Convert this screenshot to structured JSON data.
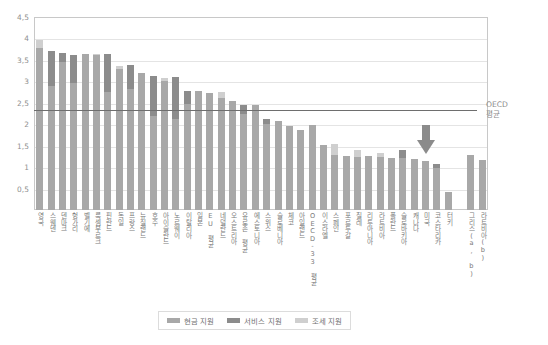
{
  "chart_data": {
    "type": "bar",
    "stacked": true,
    "title": "",
    "xlabel": "",
    "ylabel": "",
    "ylim": [
      0,
      4.5
    ],
    "ytick_labels": [
      "0,5",
      "1",
      "1,5",
      "2",
      "2,5",
      "3",
      "3,5",
      "4",
      "4,5"
    ],
    "ytick_values": [
      0.5,
      1,
      1.5,
      2,
      2.5,
      3,
      3.5,
      4,
      4.5
    ],
    "grid": true,
    "legend_position": "bottom",
    "series": [
      {
        "name": "현금 지원",
        "color": "#a8a8a8",
        "values": [
          3.78,
          2.9,
          3.45,
          2.96,
          3.63,
          3.62,
          2.76,
          3.28,
          2.82,
          3.2,
          2.2,
          3.0,
          2.13,
          2.48,
          2.78,
          2.74,
          2.61,
          2.55,
          2.24,
          2.44,
          2.0,
          2.08,
          1.95,
          1.86,
          1.98,
          1.52,
          1.29,
          1.26,
          1.24,
          1.26,
          1.23,
          1.22,
          1.22,
          1.2,
          1.14,
          0.99,
          0.42,
          0.0,
          1.28,
          1.16
        ]
      },
      {
        "name": "서비스 지원",
        "color": "#8c8c8c",
        "values": [
          0.0,
          0.8,
          0.22,
          0.66,
          0.0,
          0.0,
          0.87,
          0.0,
          0.55,
          0.0,
          0.92,
          0.0,
          0.96,
          0.3,
          0.0,
          0.0,
          0.0,
          0.0,
          0.21,
          0.0,
          0.12,
          0.0,
          0.0,
          0.0,
          0.0,
          0.0,
          0.0,
          0.0,
          0.0,
          0.0,
          0.0,
          0.0,
          0.18,
          0.0,
          0.0,
          0.09,
          0.0,
          0.0,
          0.0,
          0.0
        ]
      },
      {
        "name": "조세 지원",
        "color": "#cfcfcf",
        "values": [
          0.19,
          0.0,
          0.0,
          0.0,
          0.0,
          0.01,
          0.0,
          0.08,
          0.0,
          0.0,
          0.0,
          0.08,
          0.0,
          0.0,
          0.0,
          0.0,
          0.15,
          0.0,
          0.0,
          0.0,
          0.0,
          0.0,
          0.0,
          0.0,
          0.0,
          0.0,
          0.25,
          0.0,
          0.16,
          0.0,
          0.11,
          0.0,
          0.0,
          0.0,
          0.0,
          0.0,
          0.0,
          0.0,
          0.0,
          0.0
        ]
      }
    ],
    "categories": [
      "영국",
      "스웨덴",
      "덴마크",
      "헝가리",
      "벨기에",
      "룩셈부르크",
      "핀란드",
      "독일",
      "프랑스",
      "뉴질랜드",
      "호주",
      "아이슬란드",
      "노르웨이",
      "이탈리아",
      "일본",
      "EU 평균",
      "네덜란드",
      "오스트리아",
      "유로존 평균",
      "에스토니아",
      "스위스",
      "슬로베니아",
      "체코",
      "아일랜드",
      "OECD-33 평균",
      "이스라엘",
      "스페인",
      "포르투갈",
      "칠레",
      "리투아니아",
      "라트비아",
      "폴란드",
      "슬로바키아",
      "캐나다",
      "미국",
      "코스타리카",
      "터키",
      "",
      "그리스(a, b)",
      "라트비아(b)"
    ],
    "reference_line": {
      "label_line1": "OECD",
      "label_line2": "평균",
      "value": 2.34
    },
    "annotation_arrow": {
      "name": "arrow-marker",
      "points_to_category_index": 34,
      "color": "#8b8b8b"
    }
  },
  "legend": {
    "items": [
      {
        "label": "현금 지원",
        "color": "#a8a8a8"
      },
      {
        "label": "서비스 지원",
        "color": "#8c8c8c"
      },
      {
        "label": "조세 지원",
        "color": "#cfcfcf"
      }
    ]
  }
}
